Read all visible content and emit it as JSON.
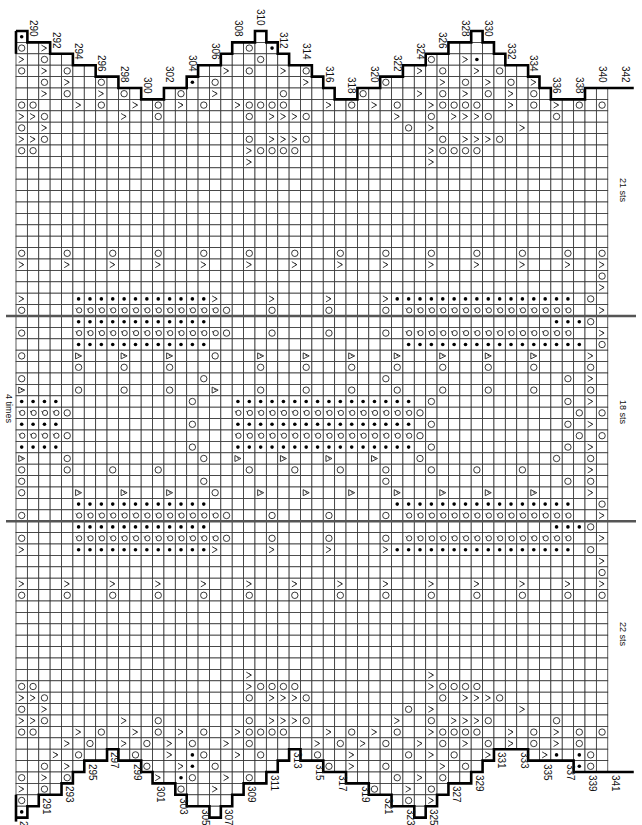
{
  "chart": {
    "grid": {
      "left": 16,
      "top": 31,
      "cols": 52,
      "cell_w": 11.38,
      "cell_h": 11.4,
      "rows": 69
    },
    "colors": {
      "grid": "#333333",
      "border": "#000000",
      "symbol": "#222222",
      "divider": "#555555"
    },
    "symbols": {
      "o": "yarn-over",
      "v": "decrease",
      "*": "bullet",
      "q": "yarn-over-small",
      "a": "triangle-decrease"
    },
    "top_labels": [
      "290",
      "292",
      "294",
      "296",
      "298",
      "300",
      "302",
      "304",
      "306",
      "308",
      "310",
      "312",
      "314",
      "316",
      "318",
      "320",
      "322",
      "324",
      "326",
      "328",
      "330",
      "332",
      "334",
      "336",
      "338",
      "340",
      "342"
    ],
    "bottom_labels": [
      "289",
      "291",
      "293",
      "295",
      "297",
      "299",
      "301",
      "303",
      "305",
      "307",
      "309",
      "311",
      "313",
      "315",
      "317",
      "319",
      "321",
      "323",
      "325",
      "327",
      "329",
      "331",
      "333",
      "335",
      "337",
      "339",
      "341"
    ],
    "side_labels": {
      "right_top": "21 sts",
      "right_middle": "18 sts",
      "right_bottom": "22 sts",
      "left_middle": "4 times"
    },
    "divider_rows": [
      24,
      42
    ],
    "rows": [
      "*...................................................",
      "o.v*..o*o.....v.....o.*.....o.v*..o.v...............",
      "v.o..v*..o.v.*o..v...o.......v.o..v.o..v*.......o...",
      "o.v.o..v.o..v.*o..v.o..v.o..v....o.v.o..v.o..v*.*o..",
      "..o.v..o.v.o..v*.o.......v.o.v..o....v.o.v.o.v.o.*o.",
      "..v.o..v.o..v.o..v.....o....v.o....v.o.v.o.v.o.v.o..",
      "oo...v.o..v.o.v.o..voooo...v.o.v.o..voooo..v.o.v.o.o",
      "vvo......v..o.......o.vvvo.......v..o.vvvo.....o....",
      "o.v...............................o.v.......v.......",
      "vvo.................o.vvvo...........o.vvvo.........",
      "oo..................voooo...........voooo...........",
      "....................v...............v...............",
      "....................................................",
      "....................................................",
      "....................................................",
      "....................................................",
      "....................................................",
      "....................................................",
      "....................................................",
      "o...o...o...o...o...o...o...o...o...o...o...o...o..o",
      "v...v...v...v...v...v...v...v...v...v...v...v...v..v",
      "...................................................o",
      "...................................................v",
      "v....************v....v....v....v****************.o",
      "o....qqqqqqqqqqqqqo...o....o....o.qqqqqqqqqqqqqqq..v",
      ".....************..............................***o",
      "o....qqqqqqqqqqqqqo...o....o....o.qqqqqqqqqqqqqqq..v",
      ".....************.................****************.o",
      "o....a...a...a...o...a...a...a...a...a...a...a....v",
      ".....o...o...o.......o...o...o...o...o...o...o....o",
      "o...............o...............o...............o.v",
      "a....o...o...o...a...o...o...o...o...o...o...o....o",
      "****...........o...****************.o...........o.v",
      "qqqqo..............qqqqqqqqqqqqqqqqo.............o.o",
      "****...........o...****************.o...........o.v",
      "qqqqo..............qqqqqqqqqqqqqqqqo.............o.o",
      "****...........o...****************.o...........o.v",
      "a...o...........o..a...a...a...a...o...........o..o",
      "o...o...o...o.......o...o...o...o...o...o...o.....v",
      "o...............o...............o...............o.o",
      "o....a...a...a...o...a...a...a...a...a...a...a....v",
      ".....************................****************..o",
      "o....qqqqqqqqqqqqqo...o....o....o.qqqqqqqqqqqqqqq..v",
      ".....************..............................***o",
      "o....qqqqqqqqqqqqqo...o....o....o.qqqqqqqqqqqqqqq..v",
      "v....************v....v....v....v****************.o",
      "...................................................v",
      "...................................................o",
      "v...v...v...v...v...v...v...v...v...v...v...v...v..v",
      "o...o...o...o...o...o...o...o...o...o...o...o...o..o",
      "....................................................",
      "....................................................",
      "....................................................",
      "....................................................",
      "....................................................",
      "....................................................",
      "....................v...............v...............",
      "oo..................voooo...........voooo...........",
      "vvo.................o.vvvo...........o.vvvo.........",
      "o.v...............................o.v.......v.......",
      "vvo......v..o.......o.vvvo.......v..o.vvvo.....o....",
      "oo...v.o..v.o.v.o..voooo...v.o.v.o..voooo..v.o.v.o.o",
      "....v.o..v.o.v.o..v.o.....v.o.v.o..v.o.v.o.v.o.v.o..",
      "...v.o..v.o..v.*o..v.o..v.o..v....o.v.o..v.o..v*.*o.",
      "..o.v..o.v.o..v*.o.......v.o.v..o....v.o.v.o.v.o.*o.",
      "o.v.o..v.o..v.*o..v.o..v.o..v....o.v.o..v.o..v*.*o..",
      "v.o..v*..o.v.*o..v...o.......v.o..v.o..v*.......o...",
      "o.v*..o*o.....v.....o.*.....o.v*..o.v...............",
      "*..................................................."
    ]
  }
}
